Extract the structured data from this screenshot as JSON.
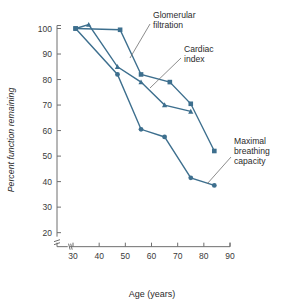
{
  "chart_data": {
    "type": "line",
    "title": "",
    "xlabel": "Age (years)",
    "ylabel": "Percent function remaining",
    "xlim": [
      28,
      90
    ],
    "ylim": [
      17,
      103
    ],
    "xticks": [
      30,
      40,
      50,
      60,
      70,
      80,
      90
    ],
    "yticks": [
      20,
      30,
      40,
      50,
      60,
      70,
      80,
      90,
      100
    ],
    "grid": false,
    "legend_position": "annotations",
    "axis_break_x": true,
    "axis_break_y": true,
    "series": [
      {
        "name": "Glomerular filtration",
        "marker": "square",
        "color": "#3d6f8e",
        "points": [
          {
            "x": 31,
            "y": 100
          },
          {
            "x": 48,
            "y": 99.5
          },
          {
            "x": 56,
            "y": 82
          },
          {
            "x": 67,
            "y": 79
          },
          {
            "x": 75,
            "y": 70.5
          },
          {
            "x": 84,
            "y": 52
          }
        ]
      },
      {
        "name": "Cardiac index",
        "marker": "triangle",
        "color": "#3d6f8e",
        "points": [
          {
            "x": 31,
            "y": 100
          },
          {
            "x": 36,
            "y": 101.5
          },
          {
            "x": 47,
            "y": 85
          },
          {
            "x": 56,
            "y": 79
          },
          {
            "x": 65,
            "y": 70
          },
          {
            "x": 75,
            "y": 67.5
          }
        ]
      },
      {
        "name": "Maximal breathing capacity",
        "marker": "circle",
        "color": "#3d6f8e",
        "points": [
          {
            "x": 31,
            "y": 100
          },
          {
            "x": 47,
            "y": 82
          },
          {
            "x": 56,
            "y": 60.5
          },
          {
            "x": 65,
            "y": 57.5
          },
          {
            "x": 75,
            "y": 41.5
          },
          {
            "x": 84,
            "y": 38.5
          }
        ]
      }
    ],
    "annotations": [
      {
        "id": "glomerular-filtration",
        "lines": [
          "Glomerular",
          "filtration"
        ],
        "text_x": 153,
        "text_y": 18,
        "leader_from": [
          150,
          24
        ],
        "leader_to": [
          130,
          58
        ]
      },
      {
        "id": "cardiac-index",
        "lines": [
          "Cardiac",
          "index"
        ],
        "text_x": 184,
        "text_y": 52,
        "leader_from": [
          181,
          58
        ],
        "leader_to": [
          150,
          88
        ]
      },
      {
        "id": "maximal-breathing-capacity",
        "lines": [
          "Maximal",
          "breathing",
          "capacity"
        ],
        "text_x": 234,
        "text_y": 144,
        "leader_from": [
          231,
          157
        ],
        "leader_to": [
          207,
          184
        ]
      }
    ]
  },
  "colors": {
    "series": "#3d6f8e",
    "axis": "#6f6f6f",
    "text": "#2b2b2b",
    "background": "#ffffff"
  }
}
